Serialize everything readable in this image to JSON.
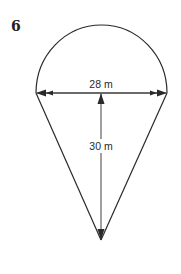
{
  "problem": {
    "number": "6"
  },
  "figure": {
    "diameter_label": "28 m",
    "height_label": "30 m",
    "line_color": "#2a2a2a",
    "background_color": "#ffffff"
  }
}
